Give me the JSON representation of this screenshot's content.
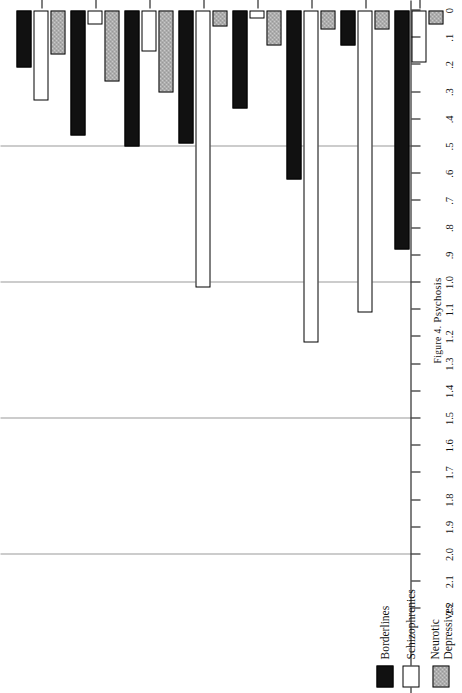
{
  "figure": {
    "caption_prefix": "Figure 4.",
    "caption_text": "Psychosis"
  },
  "legend": {
    "items": [
      {
        "label": "Borderlines",
        "swatch": "black",
        "color": "#111111"
      },
      {
        "label": "Schizophrenics",
        "swatch": "white",
        "color": "#ffffff"
      },
      {
        "label": "Neurotic\nDepressives",
        "swatch": "hatch",
        "color": "#c9c9c9"
      }
    ]
  },
  "axis": {
    "ticks": [
      "2.2",
      "2.1",
      "2.0",
      "1.9",
      "1.8",
      "1.7",
      "1.6",
      "1.5",
      "1.4",
      "1.3",
      "1.2",
      "1.1",
      "1.0",
      ".9",
      ".8",
      ".7",
      ".6",
      ".5",
      ".4",
      ".3",
      ".2",
      ".1",
      "0"
    ],
    "gridlines": [
      0.5,
      1.0,
      1.5,
      2.0
    ],
    "min": 0,
    "max": 2.2
  },
  "chart_data": {
    "type": "bar",
    "title": "Psychosis",
    "xlabel": "",
    "ylabel": "",
    "ylim": [
      0,
      2.2
    ],
    "orientation": "horizontal",
    "grid": true,
    "legend_position": "left",
    "categories": [
      "Derealization",
      "Depersonalization",
      "Depressive",
      "Paranoid",
      "Drug-Induced",
      "Hallucinations/bizarre, nihilistic,\ngrandiose delusions ( − )",
      "Mania/widespread\ndelusions ( − )",
      "Past-therapy\nRegressions"
    ],
    "series": [
      {
        "name": "Borderlines",
        "color": "#111111",
        "values": [
          0.21,
          0.46,
          0.5,
          0.49,
          0.36,
          0.62,
          0.13,
          0.88
        ]
      },
      {
        "name": "Schizophrenics",
        "color": "#ffffff",
        "values": [
          0.33,
          0.05,
          0.15,
          1.02,
          0.03,
          1.22,
          1.11,
          0.19
        ]
      },
      {
        "name": "Neurotic Depressives",
        "color": "#c9c9c9",
        "values": [
          0.16,
          0.26,
          0.3,
          0.06,
          0.13,
          0.07,
          0.07,
          0.05
        ]
      }
    ]
  }
}
